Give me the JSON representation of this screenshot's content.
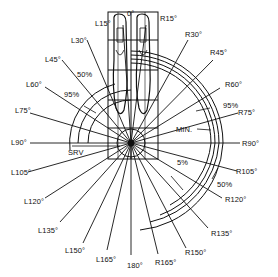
{
  "diagram": {
    "type": "angular field-of-view diagram (top view of operator feet)",
    "center_label": "SRV",
    "angle_labels": {
      "top": "0°",
      "left": [
        "L15°",
        "L30°",
        "L45°",
        "L60°",
        "L75°",
        "L90°",
        "L105°",
        "L120°",
        "L135°",
        "L150°",
        "L165°"
      ],
      "bottom": "180°",
      "right": [
        "R15°",
        "R30°",
        "R45°",
        "R60°",
        "R75°",
        "R90°",
        "R105°",
        "R120°",
        "R135°",
        "R150°",
        "R165°"
      ]
    },
    "zone_labels": {
      "left_50": "50%",
      "left_95": "95%",
      "right_95": "95%",
      "right_min": "MIN.",
      "right_5": "5%",
      "right_50": "50%"
    },
    "colors": {
      "ink": "#111111",
      "background": "#ffffff"
    }
  }
}
